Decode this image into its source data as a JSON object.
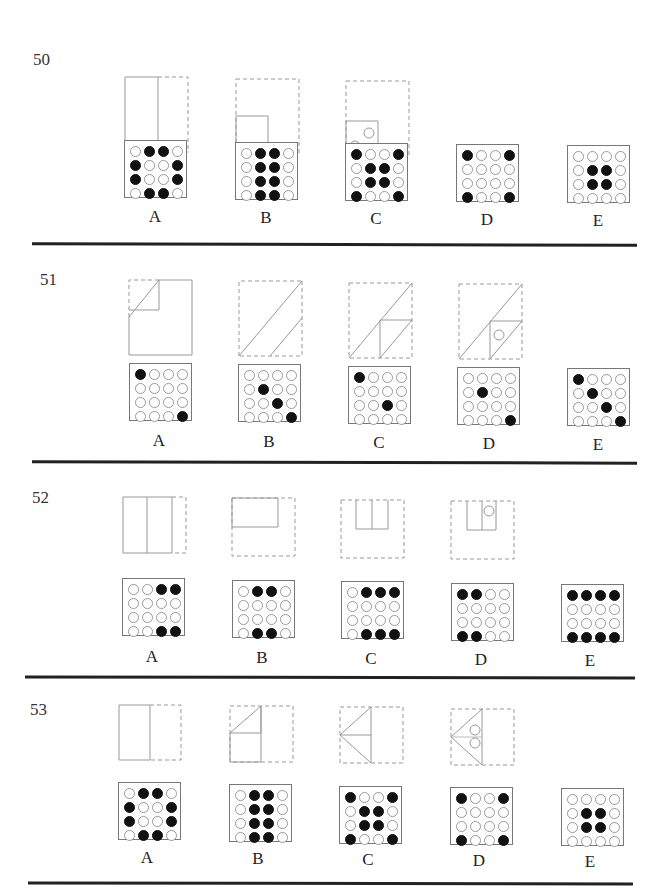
{
  "problems": [
    {
      "number": "50",
      "options": [
        "A",
        "B",
        "C",
        "D",
        "E"
      ],
      "grids": [
        [
          [
            0,
            1,
            1,
            0
          ],
          [
            1,
            0,
            0,
            1
          ],
          [
            1,
            0,
            0,
            1
          ],
          [
            0,
            1,
            1,
            0
          ]
        ],
        [
          [
            0,
            1,
            1,
            0
          ],
          [
            0,
            1,
            1,
            0
          ],
          [
            0,
            1,
            1,
            0
          ],
          [
            0,
            1,
            1,
            0
          ]
        ],
        [
          [
            1,
            0,
            0,
            1
          ],
          [
            0,
            1,
            1,
            0
          ],
          [
            0,
            1,
            1,
            0
          ],
          [
            1,
            0,
            0,
            1
          ]
        ],
        [
          [
            1,
            0,
            0,
            1
          ],
          [
            0,
            0,
            0,
            0
          ],
          [
            0,
            0,
            0,
            0
          ],
          [
            1,
            0,
            0,
            1
          ]
        ],
        [
          [
            0,
            0,
            0,
            0
          ],
          [
            0,
            1,
            1,
            0
          ],
          [
            0,
            1,
            1,
            0
          ],
          [
            0,
            0,
            0,
            0
          ]
        ]
      ]
    },
    {
      "number": "51",
      "options": [
        "A",
        "B",
        "C",
        "D",
        "E"
      ],
      "grids": [
        [
          [
            1,
            0,
            0,
            0
          ],
          [
            0,
            0,
            0,
            0
          ],
          [
            0,
            0,
            0,
            0
          ],
          [
            0,
            0,
            0,
            1
          ]
        ],
        [
          [
            0,
            0,
            0,
            0
          ],
          [
            0,
            1,
            0,
            0
          ],
          [
            0,
            0,
            1,
            0
          ],
          [
            0,
            0,
            0,
            1
          ]
        ],
        [
          [
            1,
            0,
            0,
            0
          ],
          [
            0,
            0,
            0,
            0
          ],
          [
            0,
            0,
            1,
            0
          ],
          [
            0,
            0,
            0,
            0
          ]
        ],
        [
          [
            0,
            0,
            0,
            0
          ],
          [
            0,
            1,
            0,
            0
          ],
          [
            0,
            0,
            0,
            0
          ],
          [
            0,
            0,
            0,
            1
          ]
        ],
        [
          [
            1,
            0,
            0,
            0
          ],
          [
            0,
            1,
            0,
            0
          ],
          [
            0,
            0,
            1,
            0
          ],
          [
            0,
            0,
            0,
            1
          ]
        ]
      ]
    },
    {
      "number": "52",
      "options": [
        "A",
        "B",
        "C",
        "D",
        "E"
      ],
      "grids": [
        [
          [
            0,
            0,
            1,
            1
          ],
          [
            0,
            0,
            0,
            0
          ],
          [
            0,
            0,
            0,
            0
          ],
          [
            0,
            0,
            1,
            1
          ]
        ],
        [
          [
            0,
            1,
            1,
            0
          ],
          [
            0,
            0,
            0,
            0
          ],
          [
            0,
            0,
            0,
            0
          ],
          [
            0,
            1,
            1,
            0
          ]
        ],
        [
          [
            0,
            1,
            1,
            1
          ],
          [
            0,
            0,
            0,
            0
          ],
          [
            0,
            0,
            0,
            0
          ],
          [
            0,
            1,
            1,
            1
          ]
        ],
        [
          [
            1,
            1,
            0,
            0
          ],
          [
            0,
            0,
            0,
            0
          ],
          [
            0,
            0,
            0,
            0
          ],
          [
            1,
            1,
            0,
            0
          ]
        ],
        [
          [
            1,
            1,
            1,
            1
          ],
          [
            0,
            0,
            0,
            0
          ],
          [
            0,
            0,
            0,
            0
          ],
          [
            1,
            1,
            1,
            1
          ]
        ]
      ]
    },
    {
      "number": "53",
      "options": [
        "A",
        "B",
        "C",
        "D",
        "E"
      ],
      "grids": [
        [
          [
            0,
            1,
            1,
            0
          ],
          [
            1,
            0,
            0,
            1
          ],
          [
            1,
            0,
            0,
            1
          ],
          [
            0,
            1,
            1,
            0
          ]
        ],
        [
          [
            0,
            1,
            1,
            0
          ],
          [
            0,
            1,
            1,
            0
          ],
          [
            0,
            1,
            1,
            0
          ],
          [
            0,
            1,
            1,
            0
          ]
        ],
        [
          [
            1,
            0,
            0,
            1
          ],
          [
            0,
            1,
            1,
            0
          ],
          [
            0,
            1,
            1,
            0
          ],
          [
            1,
            0,
            0,
            1
          ]
        ],
        [
          [
            1,
            0,
            0,
            1
          ],
          [
            0,
            0,
            0,
            0
          ],
          [
            0,
            0,
            0,
            0
          ],
          [
            1,
            0,
            0,
            1
          ]
        ],
        [
          [
            0,
            0,
            0,
            0
          ],
          [
            0,
            1,
            1,
            0
          ],
          [
            0,
            1,
            1,
            0
          ],
          [
            0,
            0,
            0,
            0
          ]
        ]
      ]
    }
  ]
}
